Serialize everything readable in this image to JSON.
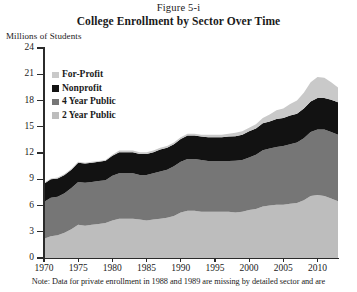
{
  "figure": {
    "caption": "Figure 5-i",
    "title": "College Enrollment by Sector Over Time",
    "note": "Note: Data for private enrollment in 1988 and 1989 are missing by detailed sector and are"
  },
  "chart_data": {
    "type": "area",
    "stacked": true,
    "title": "College Enrollment by Sector Over Time",
    "xlabel": "",
    "ylabel": "Millions of Students",
    "ylim": [
      0,
      24
    ],
    "yticks": [
      0,
      3,
      6,
      9,
      12,
      15,
      18,
      21,
      24
    ],
    "xlim": [
      1970,
      2013
    ],
    "xticks": [
      1970,
      1975,
      1980,
      1985,
      1990,
      1995,
      2000,
      2005,
      2010
    ],
    "grid": false,
    "legend_position": "upper-left",
    "legend_order": [
      "For-Profit",
      "Nonprofit",
      "4 Year Public",
      "2 Year Public"
    ],
    "stack_order_bottom_to_top": [
      "2 Year Public",
      "4 Year Public",
      "Nonprofit",
      "For-Profit"
    ],
    "colors": {
      "For-Profit": "#c9c9c9",
      "Nonprofit": "#121212",
      "4 Year Public": "#767676",
      "2 Year Public": "#bdbdbd"
    },
    "x": [
      1970,
      1971,
      1972,
      1973,
      1974,
      1975,
      1976,
      1977,
      1978,
      1979,
      1980,
      1981,
      1982,
      1983,
      1984,
      1985,
      1986,
      1987,
      1988,
      1989,
      1990,
      1991,
      1992,
      1993,
      1994,
      1995,
      1996,
      1997,
      1998,
      1999,
      2000,
      2001,
      2002,
      2003,
      2004,
      2005,
      2006,
      2007,
      2008,
      2009,
      2010,
      2011,
      2012,
      2013
    ],
    "series": [
      {
        "name": "2 Year Public",
        "values": [
          2.2,
          2.5,
          2.6,
          2.9,
          3.3,
          3.8,
          3.7,
          3.8,
          3.9,
          4.0,
          4.3,
          4.5,
          4.5,
          4.5,
          4.4,
          4.3,
          4.4,
          4.5,
          4.6,
          4.8,
          5.2,
          5.4,
          5.4,
          5.3,
          5.3,
          5.3,
          5.3,
          5.3,
          5.2,
          5.3,
          5.5,
          5.6,
          5.9,
          6.0,
          6.1,
          6.1,
          6.2,
          6.3,
          6.6,
          7.1,
          7.2,
          7.1,
          6.8,
          6.5
        ]
      },
      {
        "name": "4 Year Public",
        "values": [
          4.2,
          4.4,
          4.4,
          4.5,
          4.7,
          4.9,
          4.9,
          4.9,
          4.9,
          4.9,
          5.1,
          5.2,
          5.2,
          5.2,
          5.1,
          5.2,
          5.3,
          5.4,
          5.5,
          5.7,
          5.8,
          5.9,
          5.9,
          5.9,
          5.8,
          5.8,
          5.8,
          5.8,
          5.9,
          5.9,
          6.0,
          6.2,
          6.4,
          6.5,
          6.6,
          6.7,
          6.8,
          6.9,
          7.1,
          7.3,
          7.5,
          7.6,
          7.6,
          7.6
        ]
      },
      {
        "name": "Nonprofit",
        "values": [
          2.1,
          2.1,
          2.1,
          2.1,
          2.1,
          2.2,
          2.2,
          2.2,
          2.2,
          2.2,
          2.3,
          2.4,
          2.4,
          2.4,
          2.4,
          2.4,
          2.4,
          2.5,
          2.5,
          2.5,
          2.6,
          2.7,
          2.7,
          2.7,
          2.7,
          2.7,
          2.7,
          2.8,
          2.8,
          2.9,
          3.0,
          3.0,
          3.1,
          3.1,
          3.2,
          3.2,
          3.3,
          3.3,
          3.4,
          3.5,
          3.6,
          3.6,
          3.7,
          3.7
        ]
      },
      {
        "name": "For-Profit",
        "values": [
          0.1,
          0.1,
          0.1,
          0.1,
          0.1,
          0.1,
          0.1,
          0.1,
          0.1,
          0.1,
          0.1,
          0.2,
          0.2,
          0.2,
          0.2,
          0.2,
          0.2,
          0.2,
          0.2,
          0.2,
          0.2,
          0.2,
          0.2,
          0.2,
          0.3,
          0.3,
          0.3,
          0.3,
          0.4,
          0.4,
          0.4,
          0.5,
          0.6,
          0.8,
          1.0,
          1.1,
          1.3,
          1.5,
          1.8,
          2.2,
          2.4,
          2.3,
          2.0,
          1.7
        ]
      }
    ]
  }
}
